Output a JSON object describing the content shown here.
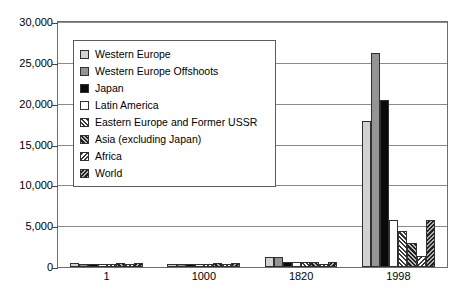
{
  "chart_data": {
    "type": "bar",
    "title": "",
    "subtitle": "",
    "xlabel": "",
    "ylabel": "",
    "categories": [
      "1",
      "1000",
      "1820",
      "1998"
    ],
    "ylim": [
      0,
      30000
    ],
    "yticks": [
      0,
      5000,
      10000,
      15000,
      20000,
      25000,
      30000
    ],
    "ytick_labels": [
      "0",
      "5,000",
      "10,000",
      "15,000",
      "20,000",
      "25,000",
      "30,000"
    ],
    "grid": true,
    "legend_position": "upper-left-inside",
    "series": [
      {
        "name": "Western Europe",
        "swatch": "light-grey-solid",
        "color": "#d2d2d2",
        "values": [
          450,
          400,
          1232,
          17921
        ]
      },
      {
        "name": "Western Europe Offshoots",
        "swatch": "mid-grey-solid",
        "color": "#949494",
        "values": [
          400,
          400,
          1201,
          26146
        ]
      },
      {
        "name": "Japan",
        "swatch": "black-solid",
        "color": "#0a0a0a",
        "values": [
          400,
          425,
          669,
          20413
        ]
      },
      {
        "name": "Latin America",
        "swatch": "white-solid",
        "color": "#ffffff",
        "values": [
          400,
          400,
          665,
          5795
        ]
      },
      {
        "name": "Eastern Europe and Former USSR",
        "swatch": "forward-hatch-light",
        "color": "#3a3a3a",
        "values": [
          400,
          400,
          667,
          4354
        ]
      },
      {
        "name": "Asia (excluding Japan)",
        "swatch": "forward-hatch-dark",
        "color": "#1f1f1f",
        "values": [
          450,
          450,
          575,
          2936
        ]
      },
      {
        "name": "Africa",
        "swatch": "back-hatch-light",
        "color": "#3a3a3a",
        "values": [
          425,
          416,
          418,
          1368
        ]
      },
      {
        "name": "World",
        "swatch": "back-hatch-dark",
        "color": "#212121",
        "values": [
          444,
          435,
          667,
          5709
        ]
      }
    ]
  },
  "legend": {
    "items": [
      {
        "label": "Western Europe"
      },
      {
        "label": "Western Europe Offshoots"
      },
      {
        "label": "Japan"
      },
      {
        "label": "Latin America"
      },
      {
        "label": "Eastern Europe and Former USSR"
      },
      {
        "label": "Asia (excluding Japan)"
      },
      {
        "label": "Africa"
      },
      {
        "label": "World"
      }
    ]
  }
}
